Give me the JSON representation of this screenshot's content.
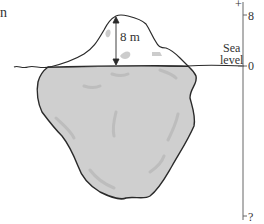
{
  "figure": {
    "partial_text": "n",
    "dimension_label": "8 m",
    "sea_label": {
      "line1": "Sea",
      "line2": "level"
    },
    "axis": {
      "direction_marker": "+",
      "ticks": [
        {
          "label": "8",
          "meaning": "top of iceberg"
        },
        {
          "label": "0",
          "meaning": "sea level"
        },
        {
          "label": "?",
          "meaning": "bottom of iceberg (unknown)"
        }
      ]
    },
    "colors": {
      "outline": "#2a2a2a",
      "underwater_fill": "#cfcfcf",
      "above_water_fill": "#ffffff",
      "shading": "#b8b8b8",
      "axis": "#666666"
    }
  }
}
